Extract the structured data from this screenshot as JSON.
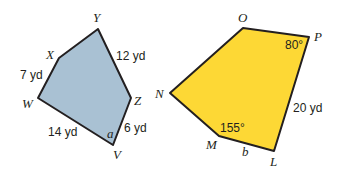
{
  "colors": {
    "left_fill": "#a9c1d3",
    "right_fill": "#fdd835",
    "stroke": "#231f20"
  },
  "left_polygon": {
    "vertices": {
      "Y": "Y",
      "X": "X",
      "W": "W",
      "V": "V",
      "Z": "Z"
    },
    "sides": {
      "XW": "7 yd",
      "YZ": "12 yd",
      "WV": "14 yd",
      "ZV": "6 yd"
    },
    "angle_label": "a"
  },
  "right_polygon": {
    "vertices": {
      "O": "O",
      "P": "P",
      "L": "L",
      "M": "M",
      "N": "N"
    },
    "sides": {
      "PL": "20 yd",
      "ML": "b"
    },
    "angles": {
      "P": "80°",
      "M": "155°"
    }
  }
}
